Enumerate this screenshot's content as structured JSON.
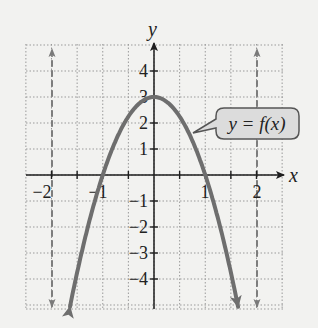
{
  "chart_data": {
    "type": "line",
    "title": "",
    "xlabel": "x",
    "ylabel": "y",
    "function_label": "y = f(x)",
    "function": "f(x) = 3 - 3x^2",
    "xlim": [
      -2.5,
      2.5
    ],
    "ylim": [
      -5.15,
      5
    ],
    "grid": true,
    "grid_style": "dotted",
    "x_grid_step": 0.5,
    "y_grid_step": 1,
    "x_ticks": [
      -2,
      -1,
      1,
      2
    ],
    "x_tick_labels": [
      "−2",
      "−1",
      "1",
      "2"
    ],
    "y_ticks": [
      4,
      3,
      2,
      1,
      -1,
      -2,
      -3,
      -4
    ],
    "y_tick_labels": [
      "4",
      "3",
      "2",
      "1",
      "−1",
      "−2",
      "−3",
      "−4"
    ],
    "vertical_asymptotes": [
      -2,
      2
    ],
    "asymptote_style": "dashed, arrows at both ends",
    "key_points": [
      {
        "x": -1,
        "y": 0
      },
      {
        "x": 0,
        "y": 3
      },
      {
        "x": 1,
        "y": 0
      }
    ],
    "series": [
      {
        "name": "y = f(x)",
        "x": [
          -1.64,
          -1.5,
          -1.25,
          -1,
          -0.75,
          -0.5,
          -0.25,
          0,
          0.25,
          0.5,
          0.75,
          1,
          1.25,
          1.5,
          1.64
        ],
        "values": [
          -5.07,
          -3.75,
          -1.69,
          0,
          1.31,
          2.25,
          2.81,
          3,
          2.81,
          2.25,
          1.31,
          0,
          -1.69,
          -3.75,
          -5.07
        ]
      }
    ]
  },
  "labels": {
    "x_axis": "x",
    "y_axis": "y",
    "callout": "y = f(x)",
    "x_ticks": [
      "−2",
      "−1",
      "1",
      "2"
    ],
    "y_ticks": [
      "4",
      "3",
      "2",
      "1",
      "−1",
      "−2",
      "−3",
      "−4"
    ]
  },
  "colors": {
    "background": "#f2f2f0",
    "grid": "#9a9a9a",
    "axis": "#1e1e1e",
    "curve": "#6e6e6e",
    "asymptote": "#7a7a7a",
    "callout_fill": "#dcdcdc",
    "callout_border": "#555555"
  }
}
